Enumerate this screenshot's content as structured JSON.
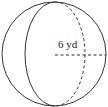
{
  "diagram": {
    "shape": "sphere",
    "radius_label": "6 yd",
    "radius_value": 6,
    "unit": "yd",
    "stroke_color": "#333333"
  }
}
